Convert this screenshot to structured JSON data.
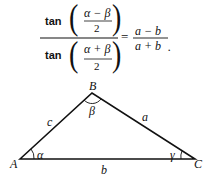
{
  "formula": {
    "numerator": {
      "func": "tan",
      "inner_num": "α − β",
      "inner_den": "2"
    },
    "denominator": {
      "func": "tan",
      "inner_num": "α + β",
      "inner_den": "2"
    },
    "equals": "=",
    "rhs_num": "a − b",
    "rhs_den": "a + b",
    "end": "."
  },
  "triangle": {
    "vertices": {
      "A": "A",
      "B": "B",
      "C": "C"
    },
    "sides": {
      "a": "a",
      "b": "b",
      "c": "c"
    },
    "angles": {
      "alpha": "α",
      "beta": "β",
      "gamma": "γ"
    }
  }
}
